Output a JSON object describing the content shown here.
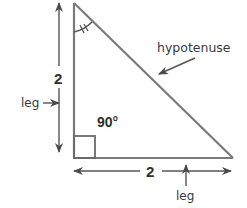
{
  "diagram": {
    "type": "right-triangle",
    "colors": {
      "stroke": "#6e6e6e",
      "arrow": "#4a4a4a",
      "text": "#3a3a3a",
      "background": "#ffffff"
    },
    "labels": {
      "vertical_side_length": "2",
      "horizontal_side_length": "2",
      "left_leg_label": "leg",
      "bottom_leg_label": "leg",
      "hypotenuse_label": "hypotenuse",
      "right_angle_label": "90°"
    },
    "marks": {
      "top_angle": "double-tick angle arc (45°)",
      "bottom_left_angle": "right-angle square"
    }
  }
}
